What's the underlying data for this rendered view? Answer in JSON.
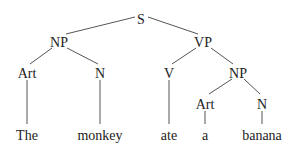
{
  "diagram": {
    "type": "syntax-tree",
    "colors": {
      "text": "#222222",
      "edge": "#555555",
      "background": "#ffffff"
    },
    "nodes": [
      {
        "id": "S",
        "label": "S",
        "x": 141,
        "y": 19
      },
      {
        "id": "NP1",
        "label": "NP",
        "x": 59,
        "y": 42
      },
      {
        "id": "VP",
        "label": "VP",
        "x": 203,
        "y": 42
      },
      {
        "id": "Art1",
        "label": "Art",
        "x": 27,
        "y": 73
      },
      {
        "id": "N1",
        "label": "N",
        "x": 100,
        "y": 73
      },
      {
        "id": "V",
        "label": "V",
        "x": 169,
        "y": 73
      },
      {
        "id": "NP2",
        "label": "NP",
        "x": 238,
        "y": 73
      },
      {
        "id": "Art2",
        "label": "Art",
        "x": 205,
        "y": 104
      },
      {
        "id": "N2",
        "label": "N",
        "x": 262,
        "y": 104
      },
      {
        "id": "w1",
        "label": "The",
        "x": 27,
        "y": 135
      },
      {
        "id": "w2",
        "label": "monkey",
        "x": 100,
        "y": 135
      },
      {
        "id": "w3",
        "label": "ate",
        "x": 169,
        "y": 135
      },
      {
        "id": "w4",
        "label": "a",
        "x": 205,
        "y": 135
      },
      {
        "id": "w5",
        "label": "banana",
        "x": 262,
        "y": 135
      }
    ],
    "edges": [
      {
        "from": "S",
        "to": "NP1",
        "x1": 135,
        "y1": 17,
        "x2": 66,
        "y2": 34
      },
      {
        "from": "S",
        "to": "VP",
        "x1": 148,
        "y1": 17,
        "x2": 198,
        "y2": 34
      },
      {
        "from": "NP1",
        "to": "Art1",
        "x1": 52,
        "y1": 48,
        "x2": 30,
        "y2": 64
      },
      {
        "from": "NP1",
        "to": "N1",
        "x1": 67,
        "y1": 48,
        "x2": 98,
        "y2": 64
      },
      {
        "from": "VP",
        "to": "V",
        "x1": 196,
        "y1": 48,
        "x2": 172,
        "y2": 64
      },
      {
        "from": "VP",
        "to": "NP2",
        "x1": 211,
        "y1": 48,
        "x2": 233,
        "y2": 64
      },
      {
        "from": "Art1",
        "to": "w1",
        "x1": 27,
        "y1": 80,
        "x2": 27,
        "y2": 124
      },
      {
        "from": "N1",
        "to": "w2",
        "x1": 100,
        "y1": 80,
        "x2": 100,
        "y2": 124
      },
      {
        "from": "V",
        "to": "w3",
        "x1": 169,
        "y1": 80,
        "x2": 169,
        "y2": 124
      },
      {
        "from": "NP2",
        "to": "Art2",
        "x1": 232,
        "y1": 79,
        "x2": 209,
        "y2": 94
      },
      {
        "from": "NP2",
        "to": "N2",
        "x1": 244,
        "y1": 79,
        "x2": 260,
        "y2": 94
      },
      {
        "from": "Art2",
        "to": "w4",
        "x1": 205,
        "y1": 111,
        "x2": 205,
        "y2": 124
      },
      {
        "from": "N2",
        "to": "w5",
        "x1": 262,
        "y1": 111,
        "x2": 262,
        "y2": 124
      }
    ]
  }
}
